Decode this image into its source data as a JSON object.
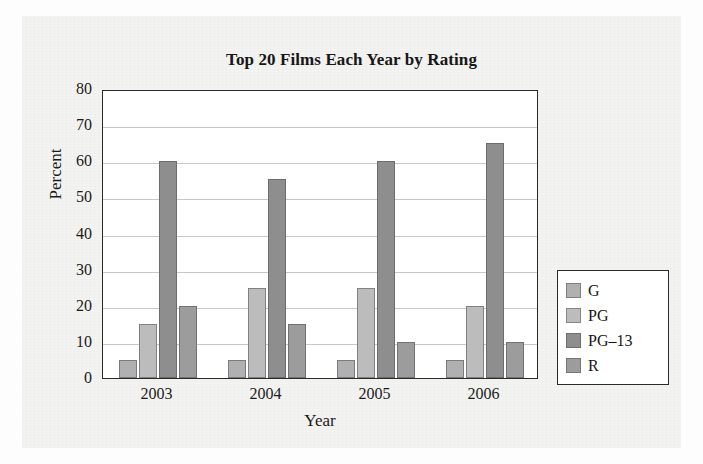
{
  "chart_data": {
    "type": "bar",
    "title": "Top 20 Films Each Year by Rating",
    "xlabel": "Year",
    "ylabel": "Percent",
    "categories": [
      "2003",
      "2004",
      "2005",
      "2006"
    ],
    "series": [
      {
        "name": "G",
        "values": [
          5,
          5,
          5,
          5
        ],
        "color": "#b0b0b0"
      },
      {
        "name": "PG",
        "values": [
          15,
          25,
          25,
          20
        ],
        "color": "#bcbcbc"
      },
      {
        "name": "PG-13",
        "values": [
          60,
          55,
          60,
          65
        ],
        "color": "#8e8e8e"
      },
      {
        "name": "R",
        "values": [
          20,
          15,
          10,
          10
        ],
        "color": "#9c9c9c"
      }
    ],
    "ylim": [
      0,
      80
    ],
    "yticks": [
      0,
      10,
      20,
      30,
      40,
      50,
      60,
      70,
      80
    ],
    "ytick_labels": [
      "0",
      "10",
      "20",
      "30",
      "40",
      "50",
      "60",
      "70",
      "80"
    ],
    "grid": "horizontal",
    "legend_position": "right-outside",
    "legend_entries": [
      "G",
      "PG",
      "PG–13",
      "R"
    ],
    "axis_color": "#2a2a2a",
    "grid_color": "#c8c8c8",
    "plot_background": "#ffffff",
    "page_background": "#f3f3f1"
  }
}
